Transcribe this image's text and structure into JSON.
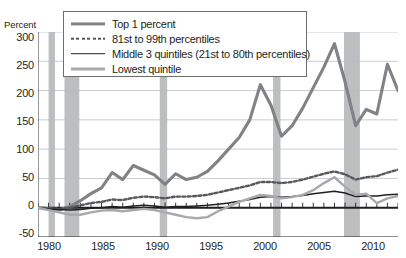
{
  "axis": {
    "ylabel": "Percent",
    "yticks": [
      "300",
      "250",
      "200",
      "150",
      "100",
      "50",
      "0",
      "-50"
    ],
    "xticks": [
      "1980",
      "1985",
      "1990",
      "1995",
      "2000",
      "2005",
      "2010"
    ]
  },
  "legend": {
    "items": [
      {
        "label": "Top 1 percent",
        "icon": "thick-gray-line-swatch"
      },
      {
        "label": "81st to 99th percentiles",
        "icon": "dotted-line-swatch"
      },
      {
        "label": "Middle 3 quintiles (21st to 80th percentiles)",
        "icon": "thin-black-line-swatch"
      },
      {
        "label": "Lowest quintile",
        "icon": "medium-gray-line-swatch"
      }
    ]
  },
  "colors": {
    "top1": "#808285",
    "p81_99": "#58595b",
    "middle3": "#231f20",
    "lowest": "#a7a9ac",
    "recession_band": "#bcbec0",
    "gridline": "#bcbec0",
    "axis": "#231f20"
  },
  "chart_data": {
    "type": "line",
    "title": "",
    "xlabel": "",
    "ylabel": "Percent",
    "xlim": [
      1979,
      2013
    ],
    "ylim": [
      -50,
      300
    ],
    "yticks": [
      -50,
      0,
      50,
      100,
      150,
      200,
      250,
      300
    ],
    "xticks": [
      1980,
      1985,
      1990,
      1995,
      2000,
      2005,
      2010
    ],
    "grid": "horizontal",
    "legend_position": "top-center",
    "x": [
      1979,
      1980,
      1981,
      1982,
      1983,
      1984,
      1985,
      1986,
      1987,
      1988,
      1989,
      1990,
      1991,
      1992,
      1993,
      1994,
      1995,
      1996,
      1997,
      1998,
      1999,
      2000,
      2001,
      2002,
      2003,
      2004,
      2005,
      2006,
      2007,
      2008,
      2009,
      2010,
      2011,
      2012,
      2013
    ],
    "series": [
      {
        "name": "Top 1 percent",
        "color": "#808285",
        "style": "solid-thick",
        "values": [
          0,
          -2,
          -4,
          2,
          12,
          24,
          34,
          60,
          48,
          72,
          64,
          56,
          40,
          58,
          48,
          52,
          62,
          80,
          100,
          120,
          150,
          210,
          175,
          122,
          140,
          170,
          205,
          240,
          280,
          215,
          140,
          168,
          160,
          245,
          200
        ]
      },
      {
        "name": "81st to 99th percentiles",
        "color": "#58595b",
        "style": "dotted",
        "values": [
          0,
          -1,
          -2,
          0,
          4,
          8,
          10,
          14,
          13,
          17,
          19,
          18,
          16,
          19,
          19,
          20,
          22,
          26,
          30,
          34,
          38,
          44,
          44,
          42,
          44,
          48,
          53,
          58,
          62,
          57,
          48,
          52,
          54,
          60,
          65
        ]
      },
      {
        "name": "Middle 3 quintiles (21st to 80th percentiles)",
        "color": "#231f20",
        "style": "solid-thin",
        "values": [
          0,
          -2,
          -3,
          -4,
          -3,
          -1,
          0,
          2,
          1,
          3,
          4,
          3,
          1,
          2,
          2,
          3,
          4,
          6,
          8,
          11,
          14,
          18,
          19,
          18,
          19,
          21,
          24,
          26,
          28,
          25,
          19,
          20,
          20,
          22,
          23
        ]
      },
      {
        "name": "Lowest quintile",
        "color": "#a7a9ac",
        "style": "solid-medium",
        "values": [
          0,
          -4,
          -8,
          -12,
          -12,
          -8,
          -5,
          -4,
          -6,
          -4,
          -2,
          -4,
          -8,
          -12,
          -16,
          -18,
          -16,
          -6,
          2,
          10,
          16,
          22,
          20,
          16,
          18,
          22,
          30,
          42,
          52,
          36,
          22,
          24,
          8,
          16,
          20
        ]
      }
    ],
    "recession_bands": [
      {
        "start": 1980.0,
        "end": 1980.6
      },
      {
        "start": 1981.5,
        "end": 1982.9
      },
      {
        "start": 1990.5,
        "end": 1991.2
      },
      {
        "start": 2001.2,
        "end": 2001.9
      },
      {
        "start": 2007.9,
        "end": 2009.4
      }
    ]
  }
}
